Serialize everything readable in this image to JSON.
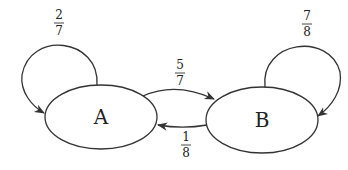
{
  "diagram": {
    "type": "markov-chain",
    "states": [
      {
        "id": "A",
        "label": "A"
      },
      {
        "id": "B",
        "label": "B"
      }
    ],
    "transitions": [
      {
        "from": "A",
        "to": "A",
        "num": "2",
        "den": "7"
      },
      {
        "from": "A",
        "to": "B",
        "num": "5",
        "den": "7"
      },
      {
        "from": "B",
        "to": "A",
        "num": "1",
        "den": "8"
      },
      {
        "from": "B",
        "to": "B",
        "num": "7",
        "den": "8"
      }
    ]
  },
  "colors": {
    "stroke": "#333333",
    "text": "#222222",
    "background": "#ffffff"
  }
}
